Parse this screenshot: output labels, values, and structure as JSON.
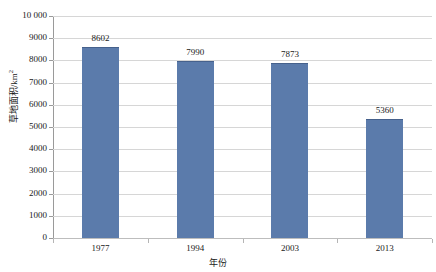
{
  "chart_data": {
    "type": "bar",
    "title": "",
    "xlabel": "年份",
    "ylabel": "草地面积/km²",
    "ylabel_base": "草地面积/km",
    "ylabel_sup": "2",
    "categories": [
      "1977",
      "1994",
      "2003",
      "2013"
    ],
    "values": [
      8602,
      7990,
      7873,
      5360
    ],
    "value_labels": [
      "8602",
      "7990",
      "7873",
      "5360"
    ],
    "ylim": [
      0,
      10000
    ],
    "ytick_values": [
      10000,
      9000,
      8000,
      7000,
      6000,
      5000,
      4000,
      3000,
      2000,
      1000,
      0
    ],
    "ytick_labels": [
      "10 000",
      "9000",
      "8000",
      "7000",
      "6000",
      "5000",
      "4000",
      "3000",
      "2000",
      "1000",
      "0"
    ],
    "grid": true,
    "legend": false,
    "legend_position": "none",
    "series": [
      {
        "name": "草地面积",
        "values": [
          8602,
          7990,
          7873,
          5360
        ]
      }
    ],
    "colors": {
      "bar_fill": "#5b7bab",
      "bar_edge": "#46618c",
      "gridline": "#d6d6d6",
      "axis_line": "#9a9a9a",
      "text": "#1a1a1a",
      "background": "#ffffff"
    }
  }
}
